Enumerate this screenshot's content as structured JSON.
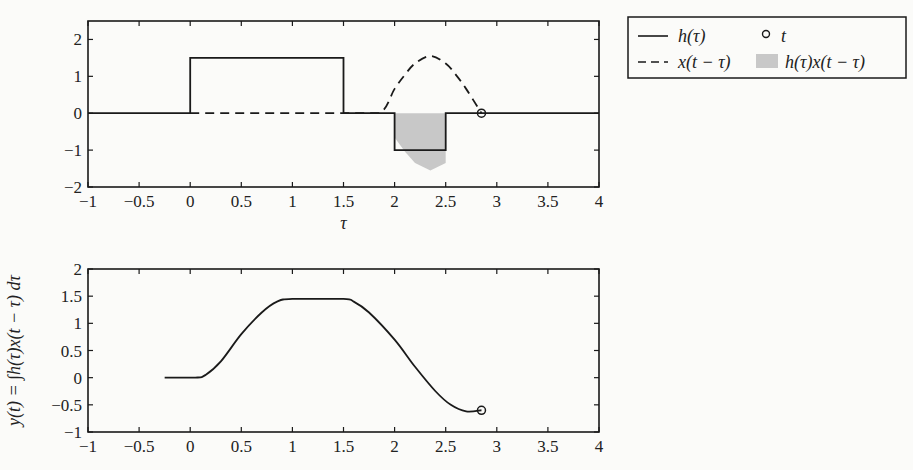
{
  "chart_data": [
    {
      "type": "line",
      "title": "",
      "xlabel": "τ",
      "ylabel": "",
      "xlim": [
        -1,
        4
      ],
      "ylim": [
        -2,
        2.5
      ],
      "xticks": [
        "−1",
        "−0.5",
        "0",
        "0.5",
        "1",
        "1.5",
        "2",
        "2.5",
        "3",
        "3.5",
        "4"
      ],
      "yticks": [
        "−2",
        "−1",
        "0",
        "1",
        "2"
      ],
      "grid": false,
      "legend_position": "outside-right-top",
      "t_value": 2.85,
      "series": [
        {
          "name": "h(τ)",
          "style": "solid",
          "x": [
            -1,
            0,
            0,
            1.5,
            1.5,
            2,
            2,
            2.5,
            2.5,
            4
          ],
          "y": [
            0,
            0,
            1.5,
            1.5,
            0,
            0,
            -1,
            -1,
            0,
            0
          ]
        },
        {
          "name": "x(t − τ)",
          "style": "dashed",
          "x": [
            0,
            1.5,
            1.85,
            2.0,
            2.1,
            2.2,
            2.35,
            2.5,
            2.6,
            2.7,
            2.85
          ],
          "y": [
            0,
            0,
            0,
            0.66,
            1.04,
            1.35,
            1.55,
            1.35,
            1.04,
            0.66,
            0
          ]
        },
        {
          "name": "h(τ)x(t − τ)",
          "style": "filled",
          "color": "#c8c8c8",
          "x": [
            2.0,
            2.1,
            2.2,
            2.35,
            2.5
          ],
          "y": [
            -0.66,
            -1.04,
            -1.35,
            -1.55,
            -1.35
          ]
        },
        {
          "name": "t",
          "style": "marker-circle",
          "x": [
            2.85
          ],
          "y": [
            0
          ]
        }
      ]
    },
    {
      "type": "line",
      "title": "",
      "xlabel": "",
      "ylabel": "y(t) = ∫h(τ)x(t − τ) dτ",
      "xlim": [
        -1,
        4
      ],
      "ylim": [
        -1,
        2
      ],
      "xticks": [
        "−1",
        "−0.5",
        "0",
        "0.5",
        "1",
        "1.5",
        "2",
        "2.5",
        "3",
        "3.5",
        "4"
      ],
      "yticks": [
        "−1",
        "−0.5",
        "0",
        "0.5",
        "1",
        "1.5",
        "2"
      ],
      "grid": false,
      "series": [
        {
          "name": "y(t)",
          "style": "solid",
          "x": [
            -0.25,
            0.05,
            0.15,
            0.3,
            0.5,
            0.7,
            0.85,
            1.0,
            1.5,
            1.6,
            1.75,
            2.0,
            2.2,
            2.4,
            2.55,
            2.7,
            2.85
          ],
          "y": [
            0,
            0,
            0.05,
            0.3,
            0.8,
            1.2,
            1.4,
            1.45,
            1.45,
            1.4,
            1.2,
            0.7,
            0.2,
            -0.25,
            -0.5,
            -0.62,
            -0.6
          ]
        },
        {
          "name": "t",
          "style": "marker-circle",
          "x": [
            2.85
          ],
          "y": [
            -0.6
          ]
        }
      ]
    }
  ],
  "legend": {
    "items": [
      {
        "label": "h(τ)",
        "symbol": "solid-line"
      },
      {
        "label": "t",
        "symbol": "circle"
      },
      {
        "label": "x(t − τ)",
        "symbol": "dashed-line"
      },
      {
        "label": "h(τ)x(t − τ)",
        "symbol": "gray-patch"
      }
    ]
  },
  "colors": {
    "line": "#1a1a1a",
    "fill": "#c8c8c8",
    "background": "#fbfbf9"
  }
}
